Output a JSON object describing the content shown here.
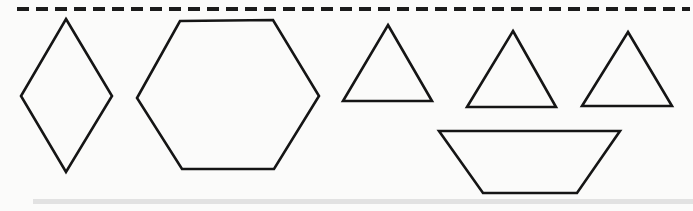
{
  "figure": {
    "canvas": {
      "width": 693,
      "height": 211
    },
    "background_color": "#fbfbfa",
    "stroke_color": "#151515",
    "stroke_width": 2.6,
    "guide_line": {
      "name": "top-dashed-guide",
      "color": "#1b1b1b",
      "thickness": 4.2,
      "y": 9,
      "x_start": 17,
      "x_end": 690,
      "dash_length": 12,
      "gap_length": 7,
      "orientation": "horizontal",
      "style": "dashed"
    },
    "footer_rule": {
      "name": "bottom-gray-rule",
      "color": "#e2e2e2",
      "x": 33,
      "y": 199,
      "width": 660,
      "height": 5
    },
    "shapes": [
      {
        "id": "shape-1",
        "name": "rhombus",
        "label": "Rhombus",
        "sides": 4,
        "points": "66,19 112,96 66,172 21,96",
        "bbox": {
          "x": 21,
          "y": 19,
          "width": 91,
          "height": 153
        }
      },
      {
        "id": "shape-2",
        "name": "hexagon",
        "label": "Hexagon",
        "sides": 6,
        "points": "180,21 273,20 319,96 274,169 182,169 137,98",
        "bbox": {
          "x": 137,
          "y": 20,
          "width": 182,
          "height": 149
        }
      },
      {
        "id": "shape-3",
        "name": "triangle-left",
        "label": "Triangle",
        "sides": 3,
        "points": "388,25 432,101 343,101",
        "bbox": {
          "x": 343,
          "y": 25,
          "width": 89,
          "height": 76
        }
      },
      {
        "id": "shape-4",
        "name": "triangle-middle",
        "label": "Triangle",
        "sides": 3,
        "points": "513,31 556,107 467,107",
        "bbox": {
          "x": 467,
          "y": 31,
          "width": 89,
          "height": 76
        }
      },
      {
        "id": "shape-5",
        "name": "triangle-right",
        "label": "Triangle",
        "sides": 3,
        "points": "628,32 672,106 582,106",
        "bbox": {
          "x": 582,
          "y": 32,
          "width": 90,
          "height": 74
        }
      },
      {
        "id": "shape-6",
        "name": "trapezoid",
        "label": "Trapezoid",
        "sides": 4,
        "points": "439,131 620,131 577,193 483,193",
        "bbox": {
          "x": 439,
          "y": 131,
          "width": 181,
          "height": 62
        }
      }
    ]
  }
}
